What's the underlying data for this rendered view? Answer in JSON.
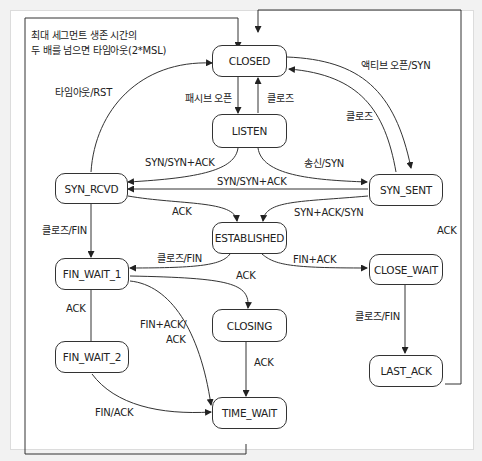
{
  "diagram": {
    "title_note": {
      "line1": "최대 세그먼트 생존 시간의",
      "line2": "두 배를 넘으면 타임아웃(2*MSL)"
    },
    "states": {
      "closed": "CLOSED",
      "listen": "LISTEN",
      "syn_rcvd": "SYN_RCVD",
      "syn_sent": "SYN_SENT",
      "established": "ESTABLISHED",
      "fin_wait_1": "FIN_WAIT_1",
      "fin_wait_2": "FIN_WAIT_2",
      "closing": "CLOSING",
      "time_wait": "TIME_WAIT",
      "close_wait": "CLOSE_WAIT",
      "last_ack": "LAST_ACK"
    },
    "transitions": {
      "closed_listen": "패시브 오픈",
      "listen_closed": "클로즈",
      "closed_syn_sent": "액티브 오픈/SYN",
      "syn_sent_closed": "클로즈",
      "syn_rcvd_closed": "타임아웃/RST",
      "listen_syn_rcvd": "SYN/SYN+ACK",
      "listen_syn_sent": "송신/SYN",
      "syn_sent_syn_rcvd": "SYN/SYN+ACK",
      "syn_rcvd_established": "ACK",
      "syn_sent_established": "SYN+ACK/SYN",
      "syn_rcvd_fin_wait_1": "클로즈/FIN",
      "established_fin_wait_1": "클로즈/FIN",
      "established_close_wait": "FIN+ACK",
      "fin_wait_1_closing": "ACK",
      "fin_wait_1_fin_wait_2": "ACK",
      "fin_wait_1_time_wait_1": "FIN+ACK/",
      "fin_wait_1_time_wait_2": "ACK",
      "closing_time_wait": "ACK",
      "fin_wait_2_time_wait": "FIN/ACK",
      "close_wait_last_ack": "클로즈/FIN",
      "last_ack_closed": "ACK"
    }
  }
}
